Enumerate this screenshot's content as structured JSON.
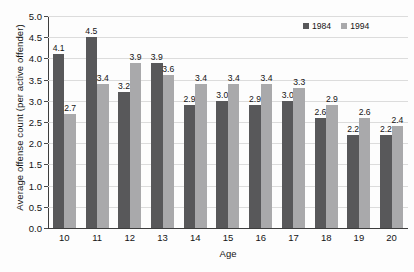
{
  "chart_data": {
    "type": "bar",
    "title": "",
    "xlabel": "Age",
    "ylabel": "Average offense count (per active offender)",
    "categories": [
      "10",
      "11",
      "12",
      "13",
      "14",
      "15",
      "16",
      "17",
      "18",
      "19",
      "20"
    ],
    "series": [
      {
        "name": "1984",
        "color": "#58585a",
        "values": [
          4.1,
          4.5,
          3.2,
          3.9,
          2.9,
          3.0,
          2.9,
          3.0,
          2.6,
          2.2,
          2.2
        ],
        "labels": [
          "4.1",
          "4.5",
          "3.2",
          "3.9",
          "2.9",
          "3.0",
          "2.9",
          "3.0",
          "2.6",
          "2.2",
          "2.2"
        ]
      },
      {
        "name": "1994",
        "color": "#a9a9ab",
        "values": [
          2.7,
          3.4,
          3.9,
          3.6,
          3.4,
          3.4,
          3.4,
          3.3,
          2.9,
          2.6,
          2.4
        ],
        "labels": [
          "2.7",
          "3.4",
          "3.9",
          "3.6",
          "3.4",
          "3.4",
          "3.4",
          "3.3",
          "2.9",
          "2.6",
          "2.4"
        ]
      }
    ],
    "ylim": [
      0.0,
      5.0
    ],
    "yticks": [
      0.0,
      0.5,
      1.0,
      1.5,
      2.0,
      2.5,
      3.0,
      3.5,
      4.0,
      4.5,
      5.0
    ],
    "ytick_labels": [
      "0.0",
      "0.5",
      "1.0",
      "1.5",
      "2.0",
      "2.5",
      "3.0",
      "3.5",
      "4.0",
      "4.5",
      "5.0"
    ],
    "grid": true,
    "grid_axis": "y",
    "legend_position": "top-right",
    "data_labels": true,
    "background": "#fdfdfd",
    "axis_color": "#3d3d3d",
    "grid_color": "#dcdcdc"
  }
}
